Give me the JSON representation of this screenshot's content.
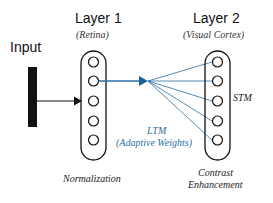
{
  "diagram": {
    "input": {
      "label": "Input"
    },
    "layer1": {
      "title": "Layer 1",
      "subtitle": "(Retina)",
      "caption": "Normalization",
      "node_count": 5
    },
    "layer2": {
      "title": "Layer 2",
      "subtitle": "(Visual Cortex)",
      "caption_line1": "Contrast",
      "caption_line2": "Enhancement",
      "side_label": "STM",
      "node_count": 5
    },
    "connections": {
      "label_line1": "LTM",
      "label_line2": "(Adaptive Weights)"
    },
    "colors": {
      "ink": "#111111",
      "connection_blue": "#2b6ea6",
      "background": "#ffffff"
    }
  }
}
